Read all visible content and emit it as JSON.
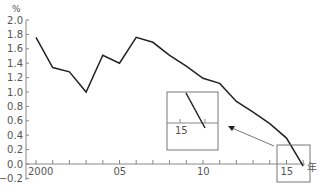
{
  "chart_data": {
    "type": "line",
    "title": "",
    "xlabel": "年",
    "ylabel": "%",
    "x": [
      2000,
      2001,
      2002,
      2003,
      2004,
      2005,
      2006,
      2007,
      2008,
      2009,
      2010,
      2011,
      2012,
      2013,
      2014,
      2015,
      2016
    ],
    "series": [
      {
        "name": "rate",
        "values": [
          1.76,
          1.34,
          1.28,
          1.0,
          1.51,
          1.4,
          1.76,
          1.69,
          1.51,
          1.36,
          1.19,
          1.12,
          0.87,
          0.72,
          0.56,
          0.36,
          -0.03
        ]
      }
    ],
    "ylim": [
      -0.2,
      2.0
    ],
    "y_ticks": [
      "2.0",
      "1.8",
      "1.6",
      "1.4",
      "1.2",
      "1.0",
      "0.8",
      "0.6",
      "0.4",
      "0.2",
      "0.0",
      "−0.2"
    ],
    "x_tick_labels": [
      "2000",
      "05",
      "10",
      "15"
    ],
    "grid": false,
    "legend": null,
    "annotations": [
      {
        "type": "highlight-box",
        "around": "2015-2016 zero crossing"
      },
      {
        "type": "inset",
        "label": "15",
        "description": "magnified view of zero crossing"
      },
      {
        "type": "arrow",
        "from": "highlight-box",
        "to": "inset"
      }
    ]
  },
  "colors": {
    "line": "#222222",
    "axis": "#888888",
    "box": "#777777"
  }
}
